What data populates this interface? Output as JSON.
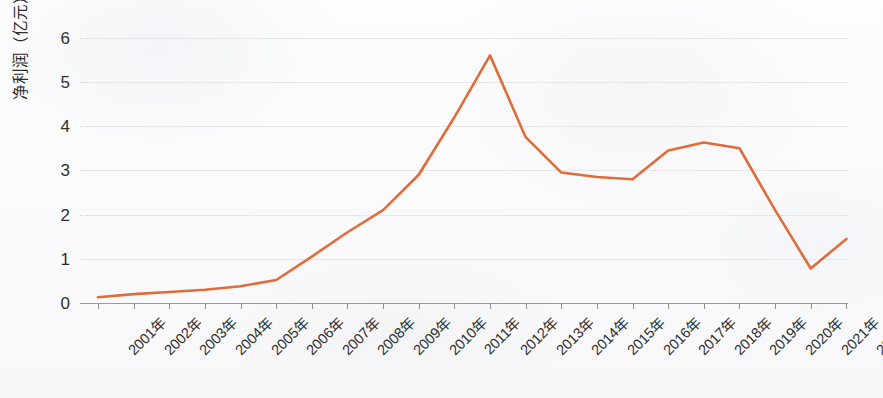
{
  "chart_data": {
    "type": "line",
    "title": "",
    "subtitle": "",
    "xlabel": "",
    "ylabel": "净利润（亿元）",
    "categories": [
      "2001年",
      "2002年",
      "2003年",
      "2004年",
      "2005年",
      "2006年",
      "2007年",
      "2008年",
      "2009年",
      "2010年",
      "2011年",
      "2012年",
      "2013年",
      "2014年",
      "2015年",
      "2016年",
      "2017年",
      "2018年",
      "2019年",
      "2020年",
      "2021年",
      "2022年"
    ],
    "values": [
      0.13,
      0.2,
      0.25,
      0.3,
      0.38,
      0.52,
      1.05,
      1.6,
      2.1,
      2.9,
      4.2,
      5.6,
      3.75,
      2.95,
      2.85,
      2.8,
      3.45,
      3.63,
      3.5,
      2.1,
      0.78,
      1.45
    ],
    "series": [
      {
        "name": "净利润（亿元）",
        "values": [
          0.13,
          0.2,
          0.25,
          0.3,
          0.38,
          0.52,
          1.05,
          1.6,
          2.1,
          2.9,
          4.2,
          5.6,
          3.75,
          2.95,
          2.85,
          2.8,
          3.45,
          3.63,
          3.5,
          2.1,
          0.78,
          1.45
        ],
        "color": "#e06c39"
      }
    ],
    "y_ticks": [
      0,
      1,
      2,
      3,
      4,
      5,
      6
    ],
    "ylim": [
      0,
      6.4
    ],
    "grid": true,
    "grid_style": "dotted-horizontal",
    "legend": "none",
    "annotations": [],
    "colors": {
      "line": "#e06c39",
      "gridline": "#ccd2dd",
      "axis": "#9a9a9a",
      "text": "#2d2d2d",
      "background": "#fbfbfc"
    }
  }
}
